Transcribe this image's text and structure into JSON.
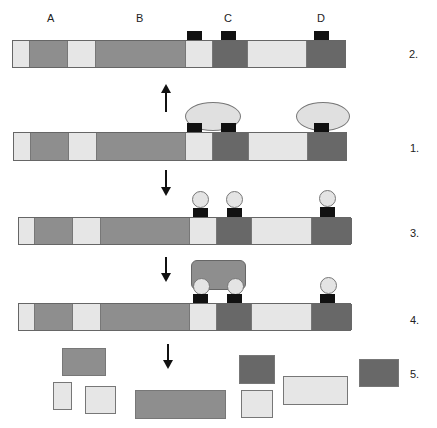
{
  "colors": {
    "light": "#e6e6e6",
    "mid": "#8e8e8e",
    "dark": "#686868",
    "black": "#111111"
  },
  "region_labels": [
    "A",
    "B",
    "C",
    "D"
  ],
  "step_labels": {
    "row1": "2.",
    "row2": "1.",
    "row3": "3.",
    "row4": "4.",
    "row5": "5."
  }
}
